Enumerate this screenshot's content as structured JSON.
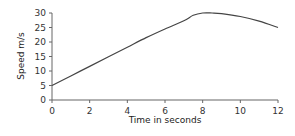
{
  "chart_data": {
    "type": "line",
    "title": "",
    "xlabel": "Time in seconds",
    "ylabel": "Speed m/s",
    "xlim": [
      0,
      12
    ],
    "ylim": [
      0,
      30
    ],
    "x_ticks": [
      0,
      2,
      4,
      6,
      8,
      10,
      12
    ],
    "y_ticks": [
      0,
      5,
      10,
      15,
      20,
      25,
      30
    ],
    "grid": false,
    "legend": null,
    "series": [
      {
        "name": "Speed",
        "x": [
          0,
          1,
          2,
          3,
          4,
          5,
          6,
          7,
          7.5,
          8,
          8.5,
          9,
          10,
          11,
          12
        ],
        "y": [
          5,
          8.3,
          11.6,
          14.9,
          18.2,
          21.5,
          24.5,
          27.3,
          29.2,
          30,
          30,
          29.8,
          28.8,
          27.2,
          25
        ]
      }
    ],
    "color": "#444444"
  }
}
